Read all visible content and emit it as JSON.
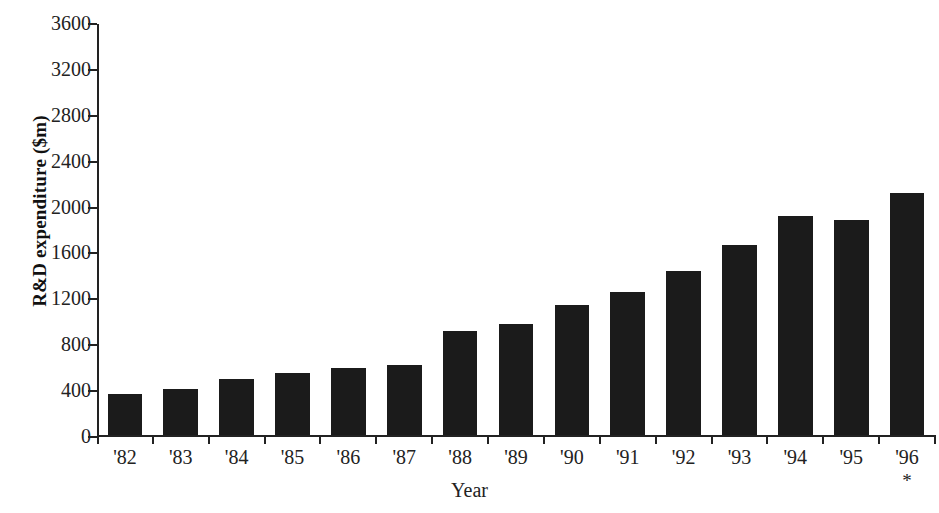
{
  "chart_data": {
    "type": "bar",
    "title": "",
    "xlabel": "Year",
    "ylabel": "R&D expenditure ($m)",
    "categories": [
      "'82",
      "'83",
      "'84",
      "'85",
      "'86",
      "'87",
      "'88",
      "'89",
      "'90",
      "'91",
      "'92",
      "'93",
      "'94",
      "'95",
      "'96"
    ],
    "values": [
      360,
      405,
      495,
      540,
      590,
      615,
      910,
      975,
      1135,
      1250,
      1440,
      1665,
      1920,
      1880,
      2120
    ],
    "ylim": [
      0,
      3600
    ],
    "ytick_labels": [
      "0",
      "400",
      "800",
      "1200",
      "1600",
      "2000",
      "2400",
      "2800",
      "3200",
      "3600"
    ],
    "yticks": [
      0,
      400,
      800,
      1200,
      1600,
      2000,
      2400,
      2800,
      3200,
      3600
    ],
    "grid": false,
    "legend": false,
    "bar_color": "#1b1b1b",
    "axis_color": "#222222",
    "background_color": "#ffffff",
    "annotations": [
      {
        "category": "'96",
        "marker": "*"
      }
    ]
  }
}
